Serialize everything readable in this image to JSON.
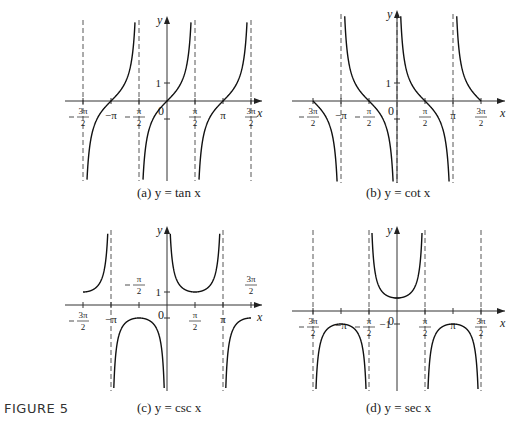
{
  "figure_label": "FIGURE 5",
  "captions": {
    "a": "(a) y = tan x",
    "b": "(b) y = cot x",
    "c": "(c) y = csc x",
    "d": "(d) y = sec x"
  },
  "chart_data": [
    {
      "type": "line",
      "title": "(a) y = tan x",
      "function": "tan",
      "xlabel": "x",
      "ylabel": "y",
      "x_ticks": [
        "-3π/2",
        "-π",
        "-π/2",
        "0",
        "π/2",
        "π",
        "3π/2"
      ],
      "y_ticks": [
        "1"
      ],
      "asymptotes": [
        "-3π/2",
        "-π/2",
        "π/2",
        "3π/2"
      ],
      "zeros": [
        "-π",
        "0",
        "π"
      ],
      "xlim": [
        "-3π/2",
        "3π/2"
      ],
      "ylim": [
        -4.5,
        4.5
      ],
      "grid": false
    },
    {
      "type": "line",
      "title": "(b) y = cot x",
      "function": "cot",
      "xlabel": "x",
      "ylabel": "y",
      "x_ticks": [
        "-3π/2",
        "-π",
        "-π/2",
        "0",
        "π/2",
        "π",
        "3π/2"
      ],
      "y_ticks": [
        "1"
      ],
      "asymptotes": [
        "-π",
        "0",
        "π"
      ],
      "zeros": [
        "-3π/2",
        "-π/2",
        "π/2",
        "3π/2"
      ],
      "xlim": [
        "-3π/2",
        "3π/2"
      ],
      "ylim": [
        -4.5,
        4.5
      ],
      "grid": false
    },
    {
      "type": "line",
      "title": "(c) y = csc x",
      "function": "csc",
      "xlabel": "x",
      "ylabel": "y",
      "x_ticks": [
        "-3π/2",
        "-π",
        "-π/2",
        "0",
        "π/2",
        "π",
        "3π/2"
      ],
      "y_ticks": [
        "1"
      ],
      "asymptotes": [
        "-π",
        "π"
      ],
      "local_extrema": [
        {
          "x": "-3π/2",
          "y": 1
        },
        {
          "x": "-π/2",
          "y": -1
        },
        {
          "x": "π/2",
          "y": 1
        },
        {
          "x": "3π/2",
          "y": -1
        }
      ],
      "xlim": [
        "-3π/2",
        "3π/2"
      ],
      "ylim": [
        -6,
        6
      ],
      "grid": false
    },
    {
      "type": "line",
      "title": "(d) y = sec x",
      "function": "sec",
      "xlabel": "x",
      "ylabel": "y",
      "x_ticks": [
        "-3π/2",
        "-π",
        "-π/2",
        "0",
        "π/2",
        "π",
        "3π/2"
      ],
      "y_ticks": [
        "-1"
      ],
      "asymptotes": [
        "-3π/2",
        "-π/2",
        "π/2",
        "3π/2"
      ],
      "local_extrema": [
        {
          "x": "-π",
          "y": -1
        },
        {
          "x": "0",
          "y": 1
        },
        {
          "x": "π",
          "y": -1
        }
      ],
      "xlim": [
        "-3π/2",
        "3π/2"
      ],
      "ylim": [
        -6,
        6
      ],
      "grid": false
    }
  ]
}
